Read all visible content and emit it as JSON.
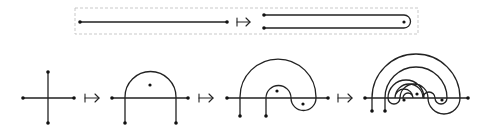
{
  "rows": [
    {
      "name": "top-row",
      "figures": [
        {
          "name": "segment",
          "description": "straight segment with two endpoints"
        },
        {
          "name": "folded-segment",
          "description": "segment folded into a U with an interior marked point"
        }
      ],
      "arrows": 1,
      "framed": true
    },
    {
      "name": "bottom-row",
      "figures": [
        {
          "name": "cross",
          "description": "horizontal and vertical segments crossing, 4 endpoints"
        },
        {
          "name": "single-arc",
          "description": "vertical strand bent into an arc over one marked point"
        },
        {
          "name": "double-arc",
          "description": "arc with nested S-shaped fold around two marked points"
        },
        {
          "name": "triple-arc",
          "description": "three nested arcs around three marked points"
        }
      ],
      "arrows": 3,
      "framed": false
    }
  ],
  "arrow_symbol": "maps-to",
  "colors": {
    "stroke": "#222222",
    "frame": "#bbbbbb",
    "background": "#ffffff"
  }
}
